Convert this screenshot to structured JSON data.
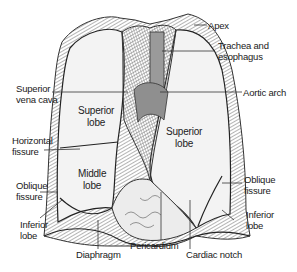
{
  "diagram": {
    "outer_labels": {
      "apex": "Apex",
      "trachea_line1": "Trachea and",
      "trachea_line2": "esophagus",
      "aortic_arch": "Aortic arch",
      "svc_line1": "Superior",
      "svc_line2": "vena cava",
      "horizontal_line1": "Horizontal",
      "horizontal_line2": "fissure",
      "oblique_left_line1": "Oblique",
      "oblique_left_line2": "fissure",
      "inferior_left_line1": "Inferior",
      "inferior_left_line2": "lobe",
      "diaphragm": "Diaphragm",
      "pericardium": "Pericardium",
      "cardiac_notch": "Cardiac notch",
      "oblique_right_line1": "Oblique",
      "oblique_right_line2": "fissure",
      "inferior_right_line1": "Inferior",
      "inferior_right_line2": "lobe"
    },
    "inner_labels": {
      "right_superior_line1": "Superior",
      "right_superior_line2": "lobe",
      "right_middle_line1": "Middle",
      "right_middle_line2": "lobe",
      "left_superior_line1": "Superior",
      "left_superior_line2": "lobe"
    },
    "colors": {
      "lung_fill": "#f2f2f2",
      "outline": "#2a2a2a",
      "shading": "#8a8a8a",
      "leader": "#333333"
    }
  }
}
